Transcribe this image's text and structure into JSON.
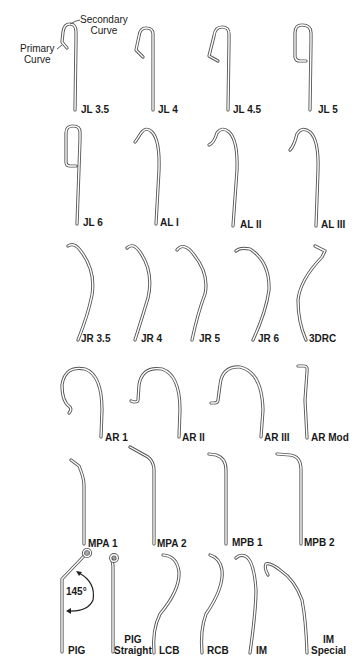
{
  "figure": {
    "annotations": {
      "secondary_curve": "Secondary\nCurve",
      "secondary_line1": "Secondary",
      "secondary_line2": "Curve",
      "primary_line1": "Primary",
      "primary_line2": "Curve",
      "pig_angle": "145°"
    },
    "catheters": [
      {
        "id": "jl35",
        "label": "JL 3.5"
      },
      {
        "id": "jl4",
        "label": "JL 4"
      },
      {
        "id": "jl45",
        "label": "JL 4.5"
      },
      {
        "id": "jl5",
        "label": "JL 5"
      },
      {
        "id": "jl6",
        "label": "JL 6"
      },
      {
        "id": "al1",
        "label": "AL I"
      },
      {
        "id": "al2",
        "label": "AL II"
      },
      {
        "id": "al3",
        "label": "AL III"
      },
      {
        "id": "jr35",
        "label": "JR 3.5"
      },
      {
        "id": "jr4",
        "label": "JR 4"
      },
      {
        "id": "jr5",
        "label": "JR 5"
      },
      {
        "id": "jr6",
        "label": "JR 6"
      },
      {
        "id": "3drc",
        "label": "3DRC"
      },
      {
        "id": "ar1",
        "label": "AR 1"
      },
      {
        "id": "ar2",
        "label": "AR II"
      },
      {
        "id": "ar3",
        "label": "AR III"
      },
      {
        "id": "armod",
        "label": "AR Mod"
      },
      {
        "id": "mpa1",
        "label": "MPA 1"
      },
      {
        "id": "mpa2",
        "label": "MPA 2"
      },
      {
        "id": "mpb1",
        "label": "MPB 1"
      },
      {
        "id": "mpb2",
        "label": "MPB 2"
      },
      {
        "id": "pig",
        "label": "PIG"
      },
      {
        "id": "pigstraight",
        "label_line1": "PIG",
        "label_line2": "Straight"
      },
      {
        "id": "lcb",
        "label": "LCB"
      },
      {
        "id": "rcb",
        "label": "RCB"
      },
      {
        "id": "im",
        "label": "IM"
      },
      {
        "id": "imspecial",
        "label_line1": "IM",
        "label_line2": "Special"
      }
    ]
  }
}
